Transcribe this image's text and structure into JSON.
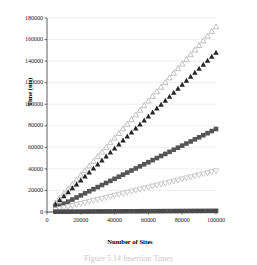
{
  "chart_data": {
    "type": "scatter",
    "title": "",
    "xlabel": "Number of Sites",
    "ylabel": "Time (ms)",
    "xlim": [
      0,
      100000
    ],
    "ylim": [
      0,
      180000
    ],
    "xticks": [
      0,
      20000,
      40000,
      60000,
      80000,
      100000
    ],
    "yticks": [
      0,
      20000,
      40000,
      60000,
      80000,
      100000,
      120000,
      140000,
      160000,
      180000
    ],
    "xtick_labels": [
      "0",
      "20000",
      "40000",
      "60000",
      "80000",
      "100000"
    ],
    "ytick_labels": [
      "0",
      "20000",
      "40000",
      "60000",
      "80000",
      "100000",
      "120000",
      "140000",
      "160000",
      "180000"
    ],
    "grid": "horizontal",
    "legend": "none",
    "x": [
      5000,
      7500,
      10000,
      12500,
      15000,
      17500,
      20000,
      22500,
      25000,
      27500,
      30000,
      32500,
      35000,
      37500,
      40000,
      42500,
      45000,
      47500,
      50000,
      52500,
      55000,
      57500,
      60000,
      62500,
      65000,
      67500,
      70000,
      72500,
      75000,
      77500,
      80000,
      82500,
      85000,
      87500,
      90000,
      92500,
      95000,
      97500,
      100000
    ],
    "series": [
      {
        "name": "series-1",
        "marker": "open-triangle-up",
        "color": "#b0b0b0",
        "values": [
          8600,
          12900,
          17200,
          21500,
          25800,
          30100,
          34400,
          38700,
          43000,
          47300,
          51600,
          55900,
          60200,
          64500,
          68800,
          73100,
          77400,
          81700,
          86000,
          90300,
          94600,
          98900,
          103200,
          107500,
          111800,
          116100,
          120400,
          124700,
          129000,
          133300,
          137600,
          141900,
          146200,
          150500,
          154800,
          159100,
          163400,
          167700,
          172000
        ]
      },
      {
        "name": "series-2",
        "marker": "filled-triangle-up",
        "color": "#262626",
        "values": [
          7400,
          11100,
          14800,
          18500,
          22200,
          25900,
          29600,
          33300,
          37000,
          40700,
          44400,
          48100,
          51800,
          55500,
          59200,
          62900,
          66600,
          70300,
          74000,
          77700,
          81400,
          85100,
          88800,
          92500,
          96200,
          99900,
          103600,
          107300,
          111000,
          114700,
          118400,
          122100,
          125800,
          129500,
          133200,
          136900,
          140600,
          144300,
          148000
        ]
      },
      {
        "name": "series-3",
        "marker": "filled-square",
        "color": "#555555",
        "values": [
          3850,
          5775,
          7700,
          9625,
          11550,
          13475,
          15400,
          17325,
          19250,
          21175,
          23100,
          25025,
          26950,
          28875,
          30800,
          32725,
          34650,
          36575,
          38500,
          40425,
          42350,
          44275,
          46200,
          48125,
          50050,
          51975,
          53900,
          55825,
          57750,
          59675,
          61600,
          63525,
          65450,
          67375,
          69300,
          71225,
          73150,
          75075,
          77000
        ]
      },
      {
        "name": "series-4",
        "marker": "open-triangle-down",
        "color": "#bdbdbd",
        "values": [
          1900,
          2850,
          3800,
          4750,
          5700,
          6650,
          7600,
          8550,
          9500,
          10450,
          11400,
          12350,
          13300,
          14250,
          15200,
          16150,
          17100,
          18050,
          19000,
          19950,
          20900,
          21850,
          22800,
          23750,
          24700,
          25650,
          26600,
          27550,
          28500,
          29450,
          30400,
          31350,
          32300,
          33250,
          34200,
          35150,
          36100,
          37050,
          38000
        ]
      },
      {
        "name": "series-5",
        "marker": "filled-square",
        "color": "#4a4a4a",
        "values": [
          300,
          320,
          340,
          360,
          380,
          400,
          420,
          440,
          460,
          480,
          500,
          520,
          540,
          560,
          580,
          600,
          620,
          640,
          660,
          680,
          700,
          720,
          740,
          760,
          780,
          800,
          820,
          840,
          860,
          880,
          900,
          920,
          940,
          960,
          980,
          1000,
          1020,
          1040,
          1060
        ]
      }
    ]
  },
  "axes": {
    "ylabel_text": "Time (ms)",
    "xlabel_text": "Number of Sites"
  },
  "caption": {
    "text": "Figure 5.14  Insertion Times"
  },
  "colors": {
    "axis": "#333333",
    "grid": "#e2e2e2",
    "text": "#1f1f1f"
  }
}
